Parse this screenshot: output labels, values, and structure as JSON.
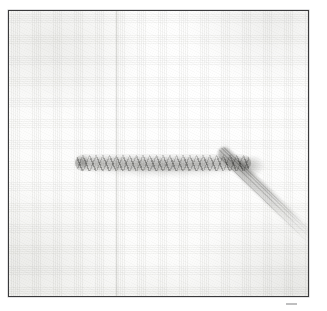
{
  "figure": {
    "kind": "scanned-photographic-plate",
    "subject": "chain-stitch embroidery sample worked on plain woven fabric",
    "caption_text": "",
    "title_text": "",
    "label_text": "",
    "colors": {
      "paper": "#ffffff",
      "frame_border": "#3a3a3c",
      "fabric_light": "#fdfdfc",
      "fabric_shade": "#eeeeec",
      "thread_dark": "#787876",
      "thread_mid": "#9e9e9c",
      "thread_light": "#e4e4e2"
    },
    "frame": {
      "name": "plate-border",
      "left": 8,
      "top": 10,
      "width": 301,
      "height": 287,
      "border_width_px": 1.6
    },
    "elements": {
      "fabric_field": "plain white woven ground cloth with visible weave",
      "fold_crease": "faint vertical fold running top to bottom, left of centre",
      "stitch_band": "horizontal band of worked chain stitches across the middle",
      "thread_tail": "loose thread tail leaving the band at its right end and running diagonally to the lower right corner",
      "stray_speck": "small dark mark on the paper just below the lower-right corner of the plate"
    }
  }
}
